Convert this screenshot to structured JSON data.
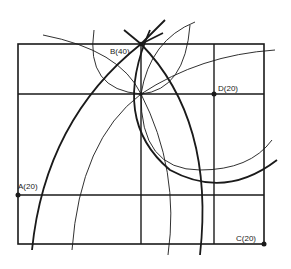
{
  "diagram": {
    "type": "geometric-construction",
    "points": [
      {
        "id": "A",
        "label": "A(20)",
        "x": 18,
        "y": 195
      },
      {
        "id": "B",
        "label": "B(40)",
        "x": 141,
        "y": 44
      },
      {
        "id": "C",
        "label": "C(20)",
        "x": 264,
        "y": 244
      },
      {
        "id": "D",
        "label": "D(20)",
        "x": 214,
        "y": 94
      }
    ],
    "colors": {
      "stroke": "#1a1a1a",
      "background": "#ffffff"
    }
  }
}
